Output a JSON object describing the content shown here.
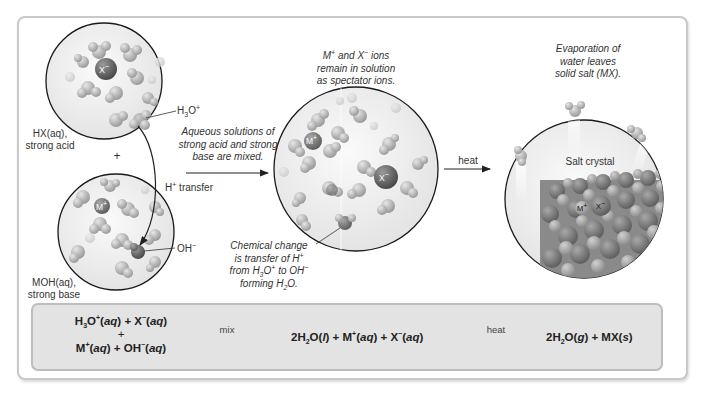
{
  "figure": {
    "colors": {
      "frame_border": "#c9c9c9",
      "equation_box_bg": "#e3e3e3",
      "equation_box_border": "#bdbdbd",
      "water_molecule": "#b8b8b8",
      "ion_dark": "#6b6b6b",
      "circle_outline": "#1a1a1a"
    }
  },
  "acid_circle": {
    "label_line1": "HX(aq),",
    "label_line2": "strong acid",
    "ion_label": "X−",
    "hydronium_callout": "H3O+"
  },
  "plus_sign": "+",
  "base_circle": {
    "label_line1": "MOH(aq),",
    "label_line2": "strong base",
    "ion_label": "M+",
    "hydroxide_callout": "OH−"
  },
  "proton_transfer": {
    "label": "H+ transfer"
  },
  "mix_caption": {
    "line1": "Aqueous solutions of",
    "line2": "strong acid and strong",
    "line3": "base are mixed."
  },
  "middle_circle": {
    "caption_line1": "M+ and X− ions",
    "caption_line2": "remain in solution",
    "caption_line3": "as spectator ions.",
    "ion_m": "M+",
    "ion_x": "X−"
  },
  "chemical_change_caption": {
    "line1": "Chemical change",
    "line2": "is transfer of H+",
    "line3": "from H3O+ to OH−",
    "line4": "forming H2O."
  },
  "heat_arrow": {
    "label": "heat"
  },
  "salt_circle": {
    "caption_line1": "Evaporation of",
    "caption_line2": "water leaves",
    "caption_line3": "solid salt (MX).",
    "crystal_label": "Salt crystal",
    "ion_m": "M+",
    "ion_x": "X−"
  },
  "equation": {
    "reactants_line1": "H3O+(aq) + X−(aq)",
    "reactants_plus": "+",
    "reactants_line2": "M+(aq) + OH−(aq)",
    "arrow1_label": "mix",
    "intermediate": "2H2O(l) + M+(aq) + X−(aq)",
    "arrow2_label": "heat",
    "products": "2H2O(g) + MX(s)"
  }
}
